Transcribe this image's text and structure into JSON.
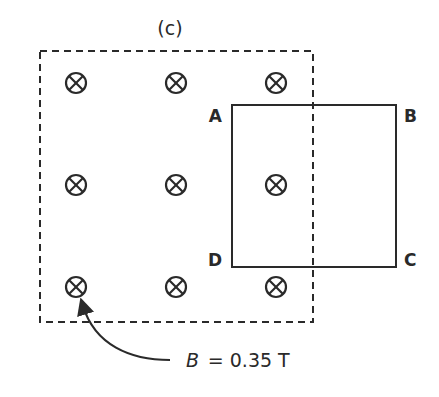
{
  "figure": {
    "panel_label": "(c)",
    "field_region": {
      "label": "B = 0.35 T",
      "symbol_label": "B",
      "value_text": "= 0.35 T",
      "direction": "into page",
      "symbol": "cross-circle-icon"
    },
    "loop": {
      "corners": {
        "A": "A",
        "B": "B",
        "C": "C",
        "D": "D"
      }
    },
    "colors": {
      "stroke": "#2a2a2a",
      "background": "#ffffff"
    }
  }
}
